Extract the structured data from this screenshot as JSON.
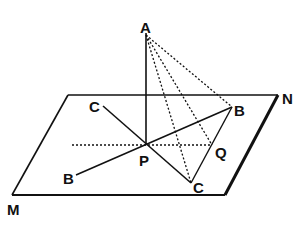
{
  "diagram": {
    "type": "geometry-3d",
    "colors": {
      "ink": "#111111",
      "background": "#ffffff"
    },
    "labels": {
      "A": "A",
      "N": "N",
      "M": "M",
      "P": "P",
      "Q": "Q",
      "B_upper": "B",
      "B_lower": "B",
      "C_upper": "C",
      "C_lower": "C"
    },
    "points": {
      "A": [
        146,
        33
      ],
      "P": [
        146,
        145
      ],
      "Q": [
        212,
        145
      ],
      "B_upper": [
        232,
        107
      ],
      "B_lower": [
        76,
        175
      ],
      "C_upper": [
        103,
        106
      ],
      "C_lower": [
        191,
        183
      ],
      "plane_top_left": [
        68,
        95
      ],
      "plane_top_right": [
        278,
        95
      ],
      "plane_bottom_right": [
        225,
        195
      ],
      "plane_bottom_left": [
        12,
        195
      ]
    },
    "solid_lines": [
      [
        "A",
        "P"
      ],
      [
        "B_lower",
        "B_upper"
      ],
      [
        "C_upper",
        "C_lower"
      ],
      [
        "B_upper",
        "C_lower"
      ]
    ],
    "dotted_lines": [
      [
        "A",
        "B_upper"
      ],
      [
        "A",
        "Q"
      ],
      [
        "A",
        "C_lower"
      ],
      [
        "dotted_left_end",
        "Q"
      ]
    ]
  }
}
